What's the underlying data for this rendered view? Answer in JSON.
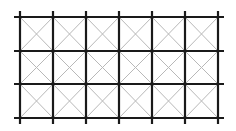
{
  "diagram": {
    "type": "grid-with-diagonals",
    "columns": 6,
    "rows": 3,
    "x_lines": [
      20,
      53,
      86,
      119,
      152,
      185,
      218
    ],
    "y_lines": [
      17,
      51,
      84,
      118
    ],
    "overhang": 6,
    "grid_color": "#1a1a1a",
    "diagonal_color": "#b8b8b8",
    "grid_width": 2.2,
    "diagonal_width": 1
  }
}
